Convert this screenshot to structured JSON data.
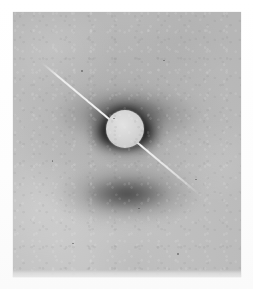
{
  "image": {
    "kind": "x-ray-fiber-diffraction-photograph",
    "title": "X-ray diffraction photograph",
    "caption": "",
    "canvas": {
      "width": 253,
      "height": 289
    },
    "background_color": "#ffffff"
  },
  "print": {
    "label": "photographic print",
    "left": 13,
    "top": 12,
    "width": 228,
    "height": 265,
    "base_color": "#bfbfbf",
    "highlight_color": "#c9c9c9",
    "edge_band_color": "#e8e8e8"
  },
  "features": {
    "beamstop": {
      "label": "beamstop disc",
      "center_x": 125,
      "center_y": 129,
      "radius": 19,
      "color": "#d7d7d7"
    },
    "beamstop_arm": {
      "label": "beamstop support arm",
      "start_x": 42,
      "start_y": 62,
      "end_x": 200,
      "end_y": 194,
      "angle_deg": 39.8,
      "color": "#fafafa"
    },
    "collar": {
      "label": "dark collar around beamstop",
      "color": "#0a0a0a"
    },
    "equatorial_lobes": [
      {
        "label": "left equatorial lobe",
        "center_x": 103,
        "center_y": 132,
        "color": "#101010"
      },
      {
        "label": "right equatorial lobe",
        "center_x": 148,
        "center_y": 132,
        "color": "#101010"
      }
    ],
    "meridional_arcs": [
      {
        "label": "upper diffuse arc",
        "center_x": 127,
        "center_y": 115,
        "color": "#262626"
      },
      {
        "label": "lower diffuse arc",
        "center_x": 127,
        "center_y": 194,
        "color": "#262626"
      }
    ],
    "diffuse_halo": {
      "label": "diffuse central halo",
      "color": "#787878"
    },
    "specks": [
      {
        "x": 0.3,
        "y": 0.22
      },
      {
        "x": 0.66,
        "y": 0.18
      },
      {
        "x": 0.17,
        "y": 0.56
      },
      {
        "x": 0.55,
        "y": 0.74
      },
      {
        "x": 0.8,
        "y": 0.63
      },
      {
        "x": 0.26,
        "y": 0.87
      },
      {
        "x": 0.72,
        "y": 0.91
      },
      {
        "x": 0.44,
        "y": 0.4
      }
    ]
  }
}
